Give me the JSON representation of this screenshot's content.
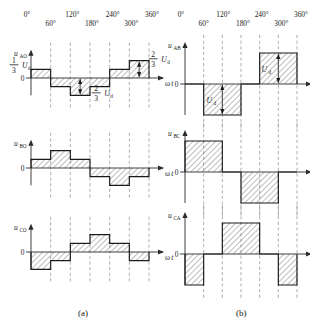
{
  "figure": {
    "title_a": "(a)",
    "title_b": "(b)",
    "angle_ticks": [
      "0°",
      "60°",
      "120°",
      "180°",
      "240°",
      "300°",
      "360°"
    ],
    "x_axis_label": "ωt",
    "zero_label": "0"
  },
  "panel_a": {
    "caption": "(a)",
    "plots": [
      {
        "id": "u_AO",
        "y_label_main": "u",
        "y_label_sub": "AO",
        "x_label": "ωt",
        "zero": "0",
        "annotations": [
          {
            "name": "one-third-ud",
            "numerator": "1",
            "denominator": "3",
            "unit": "U",
            "unit_sub": "d"
          },
          {
            "name": "two-thirds-ud",
            "numerator": "2",
            "denominator": "3",
            "unit": "U",
            "unit_sub": "d"
          }
        ]
      },
      {
        "id": "u_BO",
        "y_label_main": "u",
        "y_label_sub": "BO",
        "x_label": "ωt",
        "zero": "0",
        "annotations": [
          {
            "name": "two-thirds-ud",
            "numerator": "2",
            "denominator": "3",
            "unit": "U",
            "unit_sub": "d"
          }
        ]
      },
      {
        "id": "u_CO",
        "y_label_main": "u",
        "y_label_sub": "CO",
        "x_label": "ωt",
        "zero": "0",
        "annotations": []
      }
    ]
  },
  "panel_b": {
    "caption": "(b)",
    "plots": [
      {
        "id": "u_AB",
        "y_label_main": "u",
        "y_label_sub": "AB",
        "x_label": "ωt",
        "zero": "0",
        "annotations": [
          {
            "name": "ud-positive",
            "unit": "U",
            "unit_sub": "d"
          },
          {
            "name": "ud-negative",
            "unit": "U",
            "unit_sub": "d"
          }
        ]
      },
      {
        "id": "u_BC",
        "y_label_main": "u",
        "y_label_sub": "BC",
        "x_label": "ωt",
        "zero": "0",
        "annotations": []
      },
      {
        "id": "u_CA",
        "y_label_main": "u",
        "y_label_sub": "CA",
        "x_label": "ωt",
        "zero": "0",
        "annotations": []
      }
    ]
  },
  "chart_data": {
    "type": "line",
    "xlabel": "ωt",
    "ylabel": "",
    "x_ticks_deg": [
      0,
      60,
      120,
      180,
      240,
      300,
      360
    ],
    "x_tick_labels": [
      "0°",
      "60°",
      "120°",
      "180°",
      "240°",
      "300°",
      "360°"
    ],
    "grid": true,
    "legend": "none",
    "note_amplitudes": [
      "1/3 Ud",
      "2/3 Ud",
      "Ud"
    ],
    "series": [
      {
        "name": "u_AO",
        "panel": "a",
        "unit": "Ud",
        "levels_by_60deg_interval": [
          0.3333,
          -0.3333,
          -0.6667,
          -0.3333,
          0.3333,
          0.6667
        ],
        "ylim": [
          -0.6667,
          0.6667
        ]
      },
      {
        "name": "u_BO",
        "panel": "a",
        "unit": "Ud",
        "levels_by_60deg_interval": [
          0.3333,
          0.6667,
          0.3333,
          -0.3333,
          -0.6667,
          -0.3333
        ],
        "ylim": [
          -0.6667,
          0.6667
        ]
      },
      {
        "name": "u_CO",
        "panel": "a",
        "unit": "Ud",
        "levels_by_60deg_interval": [
          -0.6667,
          -0.3333,
          0.3333,
          0.6667,
          0.3333,
          -0.3333
        ],
        "ylim": [
          -0.6667,
          0.6667
        ]
      },
      {
        "name": "u_AB",
        "panel": "b",
        "unit": "Ud",
        "levels_by_60deg_interval": [
          0,
          -1,
          -1,
          0,
          1,
          1
        ],
        "ylim": [
          -1,
          1
        ]
      },
      {
        "name": "u_BC",
        "panel": "b",
        "unit": "Ud",
        "levels_by_60deg_interval": [
          1,
          1,
          0,
          -1,
          -1,
          0
        ],
        "ylim": [
          -1,
          1
        ]
      },
      {
        "name": "u_CA",
        "panel": "b",
        "unit": "Ud",
        "levels_by_60deg_interval": [
          -1,
          0,
          1,
          1,
          0,
          -1
        ],
        "ylim": [
          -1,
          1
        ]
      }
    ]
  }
}
